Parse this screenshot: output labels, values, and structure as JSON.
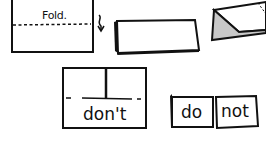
{
  "diagram": {
    "step1": {
      "fold_label": "Fold."
    },
    "step4": {
      "flap_label": "don't"
    },
    "step5": {
      "left_label": "do",
      "right_label": "not"
    }
  },
  "colors": {
    "ink": "#111111",
    "shade": "#c8c8c8",
    "paper": "#ffffff"
  }
}
